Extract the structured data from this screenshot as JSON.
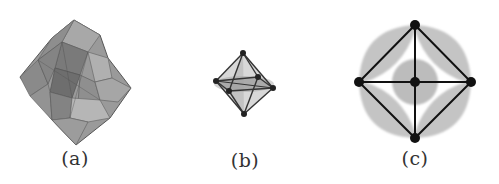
{
  "figure": {
    "panels": [
      {
        "id": "a",
        "label": "(a)",
        "description": "cluster of gray semi-transparent octahedra (polyhedral network)"
      },
      {
        "id": "b",
        "label": "(b)",
        "description": "single octahedron with shaded interior planes, 3D perspective"
      },
      {
        "id": "c",
        "label": "(c)",
        "description": "octahedron projected along axis with shaded electron density lobes"
      }
    ]
  },
  "colors": {
    "background": "#ffffff",
    "face_gray": "#8c8c8c",
    "edge_dark": "#2b2b2b",
    "vertex_black": "#111111",
    "density_gray": "#bdbdbd",
    "label": "#333333"
  }
}
